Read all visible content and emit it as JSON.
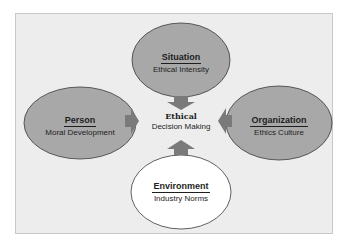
{
  "diagram": {
    "center": {
      "title": "Ethical",
      "subtitle": "Decision Making"
    },
    "nodes": [
      {
        "id": "situation",
        "title": "Situation",
        "subtitle": "Ethical Intensity",
        "position": "top",
        "fill": "#a8a8a8"
      },
      {
        "id": "person",
        "title": "Person",
        "subtitle": "Moral Development",
        "position": "left",
        "fill": "#a8a8a8"
      },
      {
        "id": "organization",
        "title": "Organization",
        "subtitle": "Ethics Culture",
        "position": "right",
        "fill": "#a8a8a8"
      },
      {
        "id": "environment",
        "title": "Environment",
        "subtitle": "Industry Norms",
        "position": "bottom",
        "fill": "#ffffff"
      }
    ],
    "arrow_color": "#7a7a7a",
    "background": "#ededed"
  }
}
